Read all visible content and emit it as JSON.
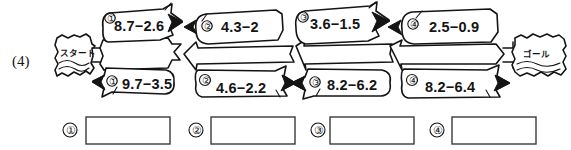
{
  "worksheet": {
    "question_number": "(4)",
    "start_label": "スタート",
    "goal_label": "ゴール"
  },
  "path": {
    "segments": [
      {
        "index": "1",
        "marker_top": "①",
        "marker_bottom": "①",
        "top_equation": "8.7−2.6",
        "bottom_equation": "9.7−3.5"
      },
      {
        "index": "2",
        "marker_top": "②",
        "marker_bottom": "②",
        "top_equation": "4.3−2",
        "bottom_equation": "4.6−2.2"
      },
      {
        "index": "3",
        "marker_top": "③",
        "marker_bottom": "③",
        "top_equation": "3.6−1.5",
        "bottom_equation": "8.2−6.2"
      },
      {
        "index": "4",
        "marker_top": "④",
        "marker_bottom": "④",
        "top_equation": "2.5−0.9",
        "bottom_equation": "8.2−6.4"
      }
    ]
  },
  "answers": {
    "boxes": [
      {
        "marker": "①",
        "value": ""
      },
      {
        "marker": "②",
        "value": ""
      },
      {
        "marker": "③",
        "value": ""
      },
      {
        "marker": "④",
        "value": ""
      }
    ]
  },
  "colors": {
    "ink": "#141414",
    "paper": "#ffffff",
    "box_border": "#3a3a3a"
  }
}
